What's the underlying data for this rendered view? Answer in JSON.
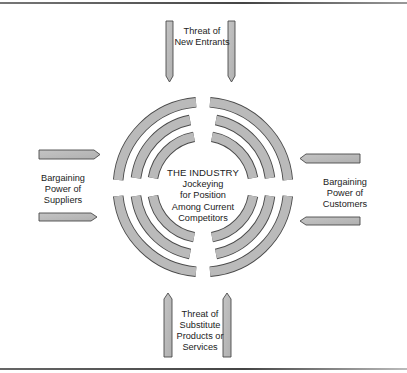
{
  "figure": {
    "title_partial": "Forces Driving Industry Competition",
    "center": {
      "title": "THE INDUSTRY",
      "lines": [
        "Jockeying",
        "for Position",
        "Among Current",
        "Competitors"
      ]
    },
    "forces": {
      "top": {
        "lines": [
          "Threat of",
          "New Entrants"
        ]
      },
      "left": {
        "lines": [
          "Bargaining",
          "Power of",
          "Suppliers"
        ]
      },
      "right": {
        "lines": [
          "Bargaining",
          "Power of",
          "Customers"
        ]
      },
      "bottom": {
        "lines": [
          "Threat of",
          "Substitute",
          "Products or",
          "Services"
        ]
      }
    },
    "colors": {
      "shape_fill": "#b9b9b9",
      "shape_stroke": "#4a4a4a",
      "text": "#222222",
      "rule": "#555555"
    }
  }
}
